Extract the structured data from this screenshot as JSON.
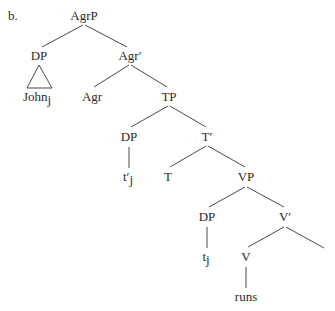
{
  "example_label": "b.",
  "tree": {
    "root": "AgrP",
    "nodes": {
      "agrp": {
        "label": "AgrP"
      },
      "dp_subject": {
        "label": "DP"
      },
      "john": {
        "label": "John",
        "subscript": "j"
      },
      "agr_bar": {
        "label": "Agr′"
      },
      "agr": {
        "label": "Agr"
      },
      "tp": {
        "label": "TP"
      },
      "dp_spec_tp": {
        "label": "DP"
      },
      "trace_prime": {
        "label": "t′",
        "subscript": "j"
      },
      "t_bar": {
        "label": "T′"
      },
      "t_head": {
        "label": "T"
      },
      "vp": {
        "label": "VP"
      },
      "dp_spec_vp": {
        "label": "DP"
      },
      "trace": {
        "label": "t",
        "subscript": "j"
      },
      "v_bar": {
        "label": "V′"
      },
      "v_head": {
        "label": "V"
      },
      "runs": {
        "label": "runs"
      }
    },
    "structure": "[AgrP [DP John_j] [Agr' [Agr] [TP [DP t'_j] [T' [T] [VP [DP t_j] [V' [V runs] [ ]]]]]]]"
  },
  "colors": {
    "line": "#4a4a4a",
    "text": "#2a2a2a",
    "background": "#ffffff"
  }
}
